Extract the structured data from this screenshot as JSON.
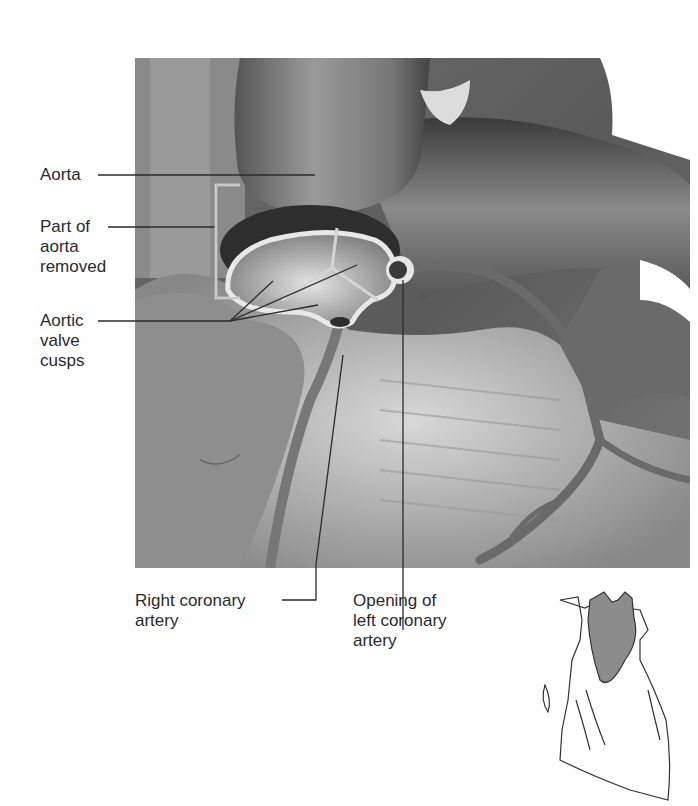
{
  "figure": {
    "labels": {
      "aorta": "Aorta",
      "part_removed": "Part of\naorta\nremoved",
      "valve_cusps": "Aortic\nvalve\ncusps",
      "right_coronary": "Right coronary\nartery",
      "left_opening": "Opening of\nleft coronary\nartery"
    },
    "inset": {
      "name": "Heart orientation diagram",
      "highlight_color": "#8c8c8c"
    },
    "colors": {
      "leader_line": "#2b2b2b",
      "bracket": "#e8e8e8",
      "background": "#ffffff"
    }
  }
}
